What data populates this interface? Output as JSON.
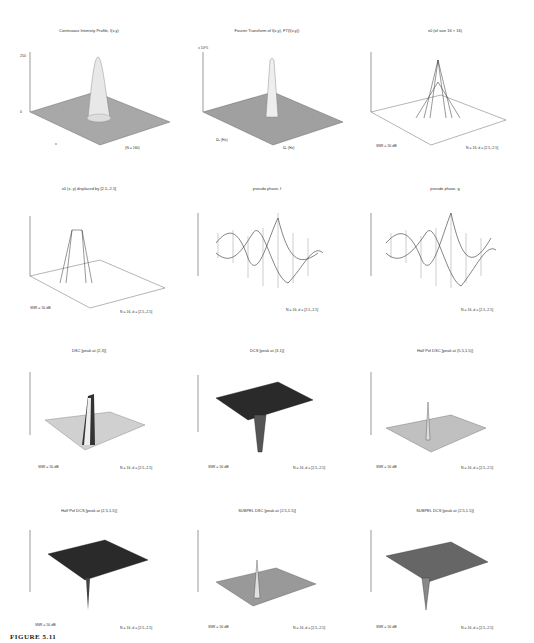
{
  "figure": {
    "caption": "FIGURE 5.11"
  },
  "panels": [
    {
      "title": "Continuous Intensity Profile, I(x,y)",
      "zticks": [
        "0",
        "50",
        "100",
        "150",
        "200",
        "250"
      ],
      "xlabel": "x",
      "ylabel": "y",
      "note": "(N = 160)",
      "xticks": [
        "-5",
        "0",
        "5"
      ],
      "yticks": [
        "-5",
        "0",
        "5"
      ]
    },
    {
      "title": "Fourier Transform of I(x,y), FT(I(x,y))",
      "zticks": [
        "1",
        "2",
        "3",
        "4",
        "5",
        "6",
        "7",
        "8"
      ],
      "zscale": "x 10^5",
      "xlabel": "Ω₁ (Hz)",
      "ylabel": "Ω₂ (Hz)",
      "xticks": [
        "-20",
        "-10",
        "0",
        "10",
        "20"
      ],
      "yticks": [
        "-20",
        "0",
        "20"
      ]
    },
    {
      "title": "x0 (of size 16 × 16)",
      "zticks": [
        "0",
        "50",
        "100",
        "150",
        "200",
        "250"
      ],
      "snr": "SNR = 50 dB",
      "note": "N = 16, d = [2.5,-2.5]",
      "xticks": [
        "2",
        "4",
        "6",
        "8",
        "10",
        "12",
        "14",
        "16"
      ],
      "yticks": [
        "5",
        "10",
        "15"
      ]
    },
    {
      "title": "x0 (x, y) displaced by [2.5,-2.5]",
      "zticks": [
        "0",
        "50",
        "100",
        "150",
        "200",
        "250"
      ],
      "snr": "SNR = 50 dB",
      "note": "N = 16, d = [2.5,-2.5]",
      "xticks": [
        "2",
        "4",
        "6",
        "8",
        "10",
        "12",
        "14",
        "16"
      ],
      "yticks": [
        "5",
        "10",
        "15"
      ]
    },
    {
      "title": "pseudo phase, f",
      "zticks": [
        "-1",
        "-0.5",
        "0",
        "0.5",
        "1"
      ],
      "snr": "",
      "note": "N = 16, d = [2.5,-2.5]",
      "xticks": [
        "0",
        "5",
        "10",
        "15",
        "20"
      ],
      "yticks": [
        "0",
        "5",
        "10",
        "15",
        "20"
      ]
    },
    {
      "title": "pseudo phase, g",
      "zticks": [
        "-1",
        "-0.5",
        "0",
        "0.5",
        "1"
      ],
      "snr": "",
      "note": "N = 16, d = [2.5,-2.5]",
      "xticks": [
        "0",
        "5",
        "10",
        "15",
        "20"
      ],
      "yticks": [
        "0",
        "5",
        "10",
        "15",
        "20"
      ]
    },
    {
      "title": "DSC [peak at (2,3)]",
      "zticks": [
        "-0.4",
        "-0.2",
        "0",
        "0.2",
        "0.4",
        "0.6",
        "0.8",
        "1"
      ],
      "snr": "SNR = 50 dB",
      "note": "N = 16, d = [2.5,-2.5]",
      "xticks": [
        "0",
        "5",
        "10",
        "15",
        "20"
      ],
      "yticks": [
        "0",
        "5",
        "10",
        "15",
        "20"
      ]
    },
    {
      "title": "DCS [peak at (3,1)]",
      "zticks": [
        "-1",
        "-0.5",
        "0",
        "0.5"
      ],
      "snr": "SNR = 50 dB",
      "note": "N = 16, d = [2.5,-2.5]",
      "xticks": [
        "0",
        "5",
        "10",
        "15",
        "20"
      ],
      "yticks": [
        "0",
        "5",
        "10",
        "15",
        "20"
      ]
    },
    {
      "title": "Half Pel DSC [peak at (5,5,1,5)]",
      "zticks": [
        "-0.2",
        "0",
        "0.2",
        "0.4",
        "0.6",
        "0.8",
        "1"
      ],
      "snr": "SNR = 50 dB",
      "note": "N = 16, d = [2.5,-2.5]",
      "xticks": [
        "0",
        "10",
        "20",
        "30",
        "40"
      ],
      "yticks": [
        "0",
        "10",
        "20",
        "30",
        "40"
      ]
    },
    {
      "title": "Half Pel DCS [peak at (2,5,1,5)]",
      "zticks": [
        "-1",
        "-0.8",
        "-0.6",
        "-0.4",
        "-0.2",
        "0",
        "0.2",
        "0.4"
      ],
      "snr": "SNR = 50 dB",
      "note": "N = 16, d = [2.5,-2.5]",
      "xticks": [
        "0",
        "10",
        "20",
        "30",
        "40"
      ],
      "yticks": [
        "0",
        "10",
        "20",
        "30",
        "40"
      ]
    },
    {
      "title": "SUBPEL DSC [peak at (2.5,1.5)]",
      "zticks": [
        "-0.4",
        "-0.2",
        "0",
        "0.2",
        "0.4",
        "0.6",
        "0.8",
        "1"
      ],
      "zlabel": "Interpolated x (1-2 dB)",
      "snr": "SNR = 50 dB",
      "note": "N = 16, d = [2.5,-2.5]",
      "xticks": [
        "0",
        "20",
        "40",
        "60",
        "80"
      ],
      "yticks": [
        "0",
        "20",
        "40",
        "60",
        "80"
      ]
    },
    {
      "title": "SUBPEL DCS [peak at (2.5,1.5)]",
      "zticks": [
        "-1",
        "-0.8",
        "-0.6",
        "-0.4",
        "-0.2",
        "0",
        "0.2",
        "0.4"
      ],
      "zlabel": "Interpolated x (1-2 dB)",
      "snr": "SNR = 50 dB",
      "note": "N = 16, d = [2.5,-2.5]",
      "xticks": [
        "0",
        "20",
        "40",
        "60",
        "80"
      ],
      "yticks": [
        "0",
        "20",
        "40",
        "60",
        "80"
      ]
    }
  ]
}
